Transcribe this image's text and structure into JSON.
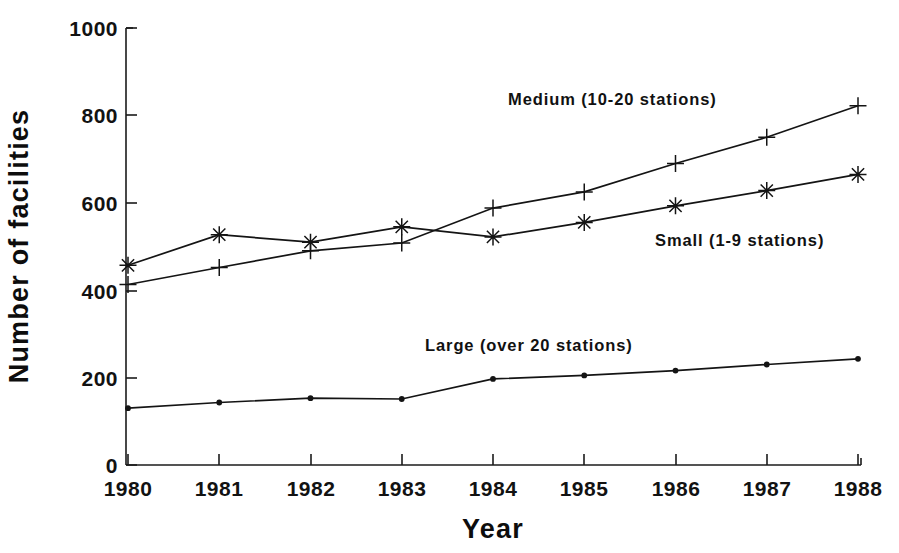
{
  "chart_data": {
    "type": "line",
    "title": "",
    "xlabel": "Year",
    "ylabel": "Number of facilities",
    "x": [
      1980,
      1981,
      1982,
      1983,
      1984,
      1985,
      1986,
      1987,
      1988
    ],
    "xtick_labels": [
      "1980",
      "1981",
      "1982",
      "1983",
      "1984",
      "1985",
      "1986",
      "1987",
      "1988"
    ],
    "ytick_labels": [
      "0",
      "200",
      "400",
      "600",
      "800",
      "1000"
    ],
    "yticks": [
      0,
      200,
      400,
      600,
      800,
      1000
    ],
    "ylim": [
      0,
      1000
    ],
    "xlim": [
      1980,
      1988
    ],
    "grid": false,
    "legend_position": "inline-annotations",
    "series": [
      {
        "name": "Medium (10-20 stations)",
        "marker": "plus",
        "values": [
          413,
          452,
          490,
          508,
          588,
          625,
          690,
          750,
          822
        ]
      },
      {
        "name": "Small (1-9 stations)",
        "marker": "star",
        "values": [
          457,
          527,
          510,
          545,
          522,
          555,
          593,
          628,
          665
        ]
      },
      {
        "name": "Large (over 20 stations)",
        "marker": "dot",
        "values": [
          130,
          143,
          153,
          151,
          197,
          205,
          216,
          230,
          243
        ]
      }
    ],
    "annotations": [
      {
        "text": "Medium (10-20 stations)",
        "x": 1984.1,
        "y": 880
      },
      {
        "text": "Small (1-9 stations)",
        "x": 1985.9,
        "y": 500
      },
      {
        "text": "Large (over 20 stations)",
        "x": 1982.7,
        "y": 290
      }
    ],
    "colors": {
      "axis": "#1b1b1b",
      "line": "#141414",
      "text": "#111111",
      "background": "#ffffff"
    }
  },
  "labels": {
    "y_axis_title": "Number of facilities",
    "x_axis_title": "Year",
    "series_medium": "Medium (10-20 stations)",
    "series_small": "Small (1-9 stations)",
    "series_large": "Large (over 20 stations)",
    "ytick_0": "0",
    "ytick_200": "200",
    "ytick_400": "400",
    "ytick_600": "600",
    "ytick_800": "800",
    "ytick_1000": "1000",
    "xtick_1980": "1980",
    "xtick_1981": "1981",
    "xtick_1982": "1982",
    "xtick_1983": "1983",
    "xtick_1984": "1984",
    "xtick_1985": "1985",
    "xtick_1986": "1986",
    "xtick_1987": "1987",
    "xtick_1988": "1988"
  }
}
